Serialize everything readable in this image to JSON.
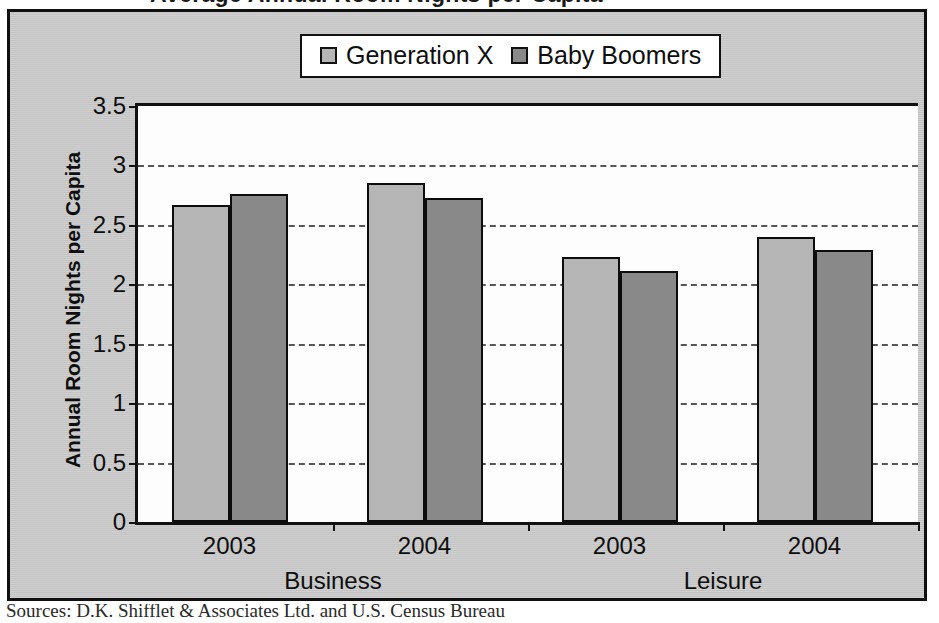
{
  "title": "Average Annual Room Nights per Capita",
  "source_note": "Sources: D.K. Shifflet & Associates Ltd. and U.S. Census Bureau",
  "legend": {
    "items": [
      {
        "label": "Generation X",
        "color": "#b6b6b6",
        "swatch_icon": "square-swatch-icon"
      },
      {
        "label": "Baby Boomers",
        "color": "#898989",
        "swatch_icon": "square-swatch-icon"
      }
    ]
  },
  "axes": {
    "y_title": "Annual Room Nights per Capita",
    "y_ticks": [
      "0",
      "0.5",
      "1",
      "1.5",
      "2",
      "2.5",
      "3",
      "3.5"
    ],
    "x_years": [
      "2003",
      "2004",
      "2003",
      "2004"
    ],
    "x_groups": [
      "Business",
      "Leisure"
    ]
  },
  "chart_data": {
    "type": "bar",
    "title": "Average Annual Room Nights per Capita",
    "xlabel": "",
    "ylabel": "Annual Room Nights per Capita",
    "ylim": [
      0,
      3.5
    ],
    "ytick_step": 0.5,
    "grid": true,
    "legend_position": "top-center",
    "categories": [
      "Business 2003",
      "Business 2004",
      "Leisure 2003",
      "Leisure 2004"
    ],
    "group_labels": [
      "Business",
      "Business",
      "Leisure",
      "Leisure"
    ],
    "year_labels": [
      "2003",
      "2004",
      "2003",
      "2004"
    ],
    "series": [
      {
        "name": "Generation X",
        "color": "#b6b6b6",
        "values": [
          2.67,
          2.85,
          2.23,
          2.4
        ]
      },
      {
        "name": "Baby Boomers",
        "color": "#898989",
        "values": [
          2.76,
          2.73,
          2.11,
          2.29
        ]
      }
    ],
    "source": "Sources: D.K. Shifflet & Associates Ltd. and U.S. Census Bureau"
  }
}
